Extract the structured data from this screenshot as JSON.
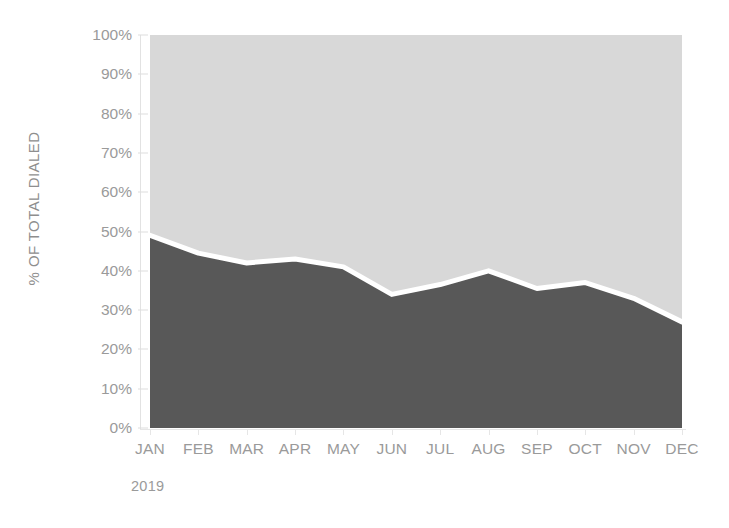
{
  "chart_data": {
    "type": "area",
    "title": "",
    "subtitle": "",
    "xlabel": "2019",
    "ylabel": "% OF TOTAL DIALED",
    "categories": [
      "JAN",
      "FEB",
      "MAR",
      "APR",
      "MAY",
      "JUN",
      "JUL",
      "AUG",
      "SEP",
      "OCT",
      "NOV",
      "DEC"
    ],
    "ylim": [
      0,
      100
    ],
    "ytick_labels": [
      "0%",
      "10%",
      "20%",
      "30%",
      "40%",
      "50%",
      "60%",
      "70%",
      "80%",
      "90%",
      "100%"
    ],
    "ytick_values": [
      0,
      10,
      20,
      30,
      40,
      50,
      60,
      70,
      80,
      90,
      100
    ],
    "grid": false,
    "legend_position": "none",
    "stacked": true,
    "series": [
      {
        "name": "lower-band",
        "color": "#585858",
        "values": [
          49,
          44.5,
          42,
          43,
          41,
          34,
          36.5,
          40,
          35.5,
          37,
          33,
          27
        ]
      },
      {
        "name": "upper-band",
        "color": "#d8d8d8",
        "values": [
          51,
          55.5,
          58,
          57,
          59,
          66,
          63.5,
          60,
          64.5,
          63,
          67,
          73
        ]
      }
    ],
    "divider": {
      "name": "band-divider-line",
      "color": "#ffffff",
      "width_px": 5
    }
  },
  "axes": {
    "y_axis_title": "% OF TOTAL DIALED",
    "y_ticks": [
      "100%",
      "90%",
      "80%",
      "70%",
      "60%",
      "50%",
      "40%",
      "30%",
      "20%",
      "10%",
      "0%"
    ],
    "x_ticks": [
      "JAN",
      "FEB",
      "MAR",
      "APR",
      "MAY",
      "JUN",
      "JUL",
      "AUG",
      "SEP",
      "OCT",
      "NOV",
      "DEC"
    ],
    "x_axis_caption": "2019"
  },
  "colors": {
    "upper_area": "#d8d8d8",
    "lower_area": "#585858",
    "divider_line": "#ffffff",
    "axis_text": "#9a9a9a",
    "axis_line": "#e2e2e2",
    "background": "#ffffff"
  }
}
